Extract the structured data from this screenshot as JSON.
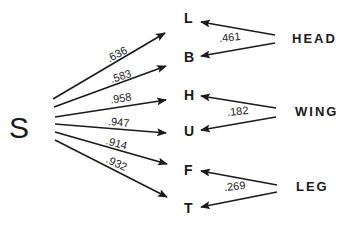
{
  "source": {
    "label": "S"
  },
  "targets": [
    {
      "label": "L",
      "weight": ".636"
    },
    {
      "label": "B",
      "weight": ".583"
    },
    {
      "label": "H",
      "weight": ".958"
    },
    {
      "label": "U",
      "weight": ".947"
    },
    {
      "label": "F",
      "weight": ".914"
    },
    {
      "label": "T",
      "weight": ".932"
    }
  ],
  "groups": [
    {
      "label": "HEAD",
      "targets": [
        "L",
        "B"
      ],
      "weight": ".461"
    },
    {
      "label": "WING",
      "targets": [
        "H",
        "U"
      ],
      "weight": ".182"
    },
    {
      "label": "LEG",
      "targets": [
        "F",
        "T"
      ],
      "weight": ".269"
    }
  ],
  "colors": {
    "ink": "#1a1a1a",
    "background": "#ffffff"
  }
}
